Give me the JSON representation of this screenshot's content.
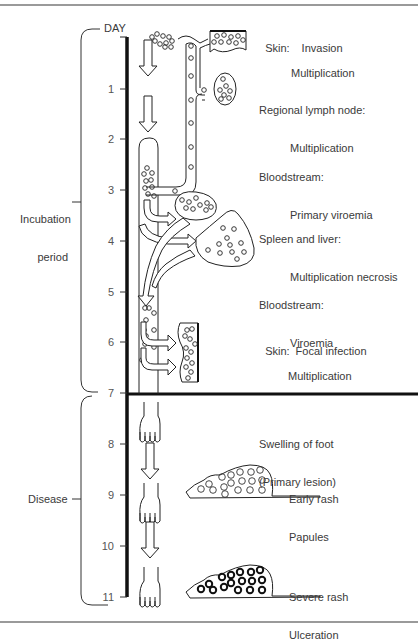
{
  "axis": {
    "title": "DAY",
    "days": [
      "1",
      "2",
      "3",
      "4",
      "5",
      "6",
      "7",
      "8",
      "9",
      "10",
      "11"
    ]
  },
  "periods": {
    "incubation_line1": "Incubation",
    "incubation_line2": "period",
    "disease": "Disease"
  },
  "stages": [
    {
      "head": "Skin:",
      "body": "Invasion",
      "body2": "Multiplication"
    },
    {
      "head": "Regional lymph node:",
      "body": "Multiplication"
    },
    {
      "head": "Bloodstream:",
      "body": "Primary viroemia"
    },
    {
      "head": "Spleen and liver:",
      "body": "Multiplication necrosis"
    },
    {
      "head": "Bloodstream:",
      "body": "Viroemia"
    },
    {
      "head": "Skin:",
      "body": "Focal infection",
      "body2": "Multiplication"
    },
    {
      "head": "Swelling of foot",
      "body": "(Primary lesion)"
    },
    {
      "head": "Early rash",
      "body": "Papules"
    },
    {
      "head": "Severe rash",
      "body": "Ulceration"
    }
  ],
  "colors": {
    "ink": "#1a1a1a",
    "rule": "#9a9a9a",
    "text": "#3a3a3a"
  }
}
